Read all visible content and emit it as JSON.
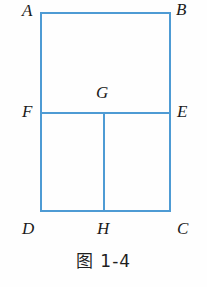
{
  "figure": {
    "caption": "图 1-4",
    "line_color": "#4e9bd4",
    "label_color": "#1b1b1b",
    "background": "#fefefe",
    "stroke_width": 2,
    "labels": [
      {
        "id": "A",
        "text": "A",
        "x": 22,
        "y": 2,
        "name": "vertex-label-a"
      },
      {
        "id": "B",
        "text": "B",
        "x": 176,
        "y": 1,
        "name": "vertex-label-b"
      },
      {
        "id": "F",
        "text": "F",
        "x": 22,
        "y": 103,
        "name": "vertex-label-f"
      },
      {
        "id": "G",
        "text": "G",
        "x": 96,
        "y": 84,
        "name": "vertex-label-g"
      },
      {
        "id": "E",
        "text": "E",
        "x": 177,
        "y": 103,
        "name": "vertex-label-e"
      },
      {
        "id": "D",
        "text": "D",
        "x": 22,
        "y": 220,
        "name": "vertex-label-d"
      },
      {
        "id": "H",
        "text": "H",
        "x": 97,
        "y": 220,
        "name": "vertex-label-h"
      },
      {
        "id": "C",
        "text": "C",
        "x": 177,
        "y": 220,
        "name": "vertex-label-c"
      }
    ],
    "points": {
      "A": {
        "x": 41,
        "y": 13
      },
      "B": {
        "x": 170,
        "y": 13
      },
      "C": {
        "x": 170,
        "y": 211
      },
      "D": {
        "x": 41,
        "y": 211
      },
      "E": {
        "x": 170,
        "y": 113
      },
      "F": {
        "x": 41,
        "y": 113
      },
      "G": {
        "x": 104,
        "y": 113
      },
      "H": {
        "x": 104,
        "y": 211
      }
    },
    "segments": [
      {
        "name": "segment-ab",
        "from": "A",
        "to": "B"
      },
      {
        "name": "segment-bc",
        "from": "B",
        "to": "C"
      },
      {
        "name": "segment-cd",
        "from": "C",
        "to": "D"
      },
      {
        "name": "segment-da",
        "from": "D",
        "to": "A"
      },
      {
        "name": "segment-fe",
        "from": "F",
        "to": "E"
      },
      {
        "name": "segment-gh",
        "from": "G",
        "to": "H"
      }
    ]
  }
}
